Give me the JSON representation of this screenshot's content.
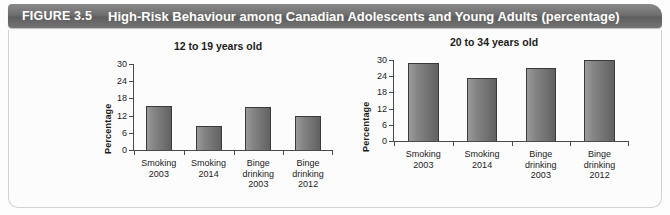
{
  "header": {
    "figure_number": "FIGURE 3.5",
    "title": "High-Risk Behaviour among Canadian Adolescents and Young Adults (percentage)",
    "banner_color": "#6f6f6f",
    "text_color": "#ffffff"
  },
  "chart_data": [
    {
      "type": "bar",
      "title": "12 to 19 years old",
      "xlabel": "",
      "ylabel": "Percentage",
      "ylim": [
        0,
        30
      ],
      "yticks": [
        0,
        6,
        12,
        18,
        24,
        30
      ],
      "grid": false,
      "legend": "none",
      "categories": [
        "Smoking\n2003",
        "Smoking\n2014",
        "Binge\ndrinking\n2003",
        "Binge\ndrinking\n2012"
      ],
      "category_lines": [
        [
          "Smoking",
          "2003"
        ],
        [
          "Smoking",
          "2014"
        ],
        [
          "Binge",
          "drinking",
          "2003"
        ],
        [
          "Binge",
          "drinking",
          "2012"
        ]
      ],
      "values": [
        15.5,
        8.5,
        15,
        12
      ],
      "bar_color": "#7b7b7b"
    },
    {
      "type": "bar",
      "title": "20 to 34 years old",
      "xlabel": "",
      "ylabel": "Percentage",
      "ylim": [
        0,
        30
      ],
      "yticks": [
        0,
        6,
        12,
        18,
        24,
        30
      ],
      "grid": false,
      "legend": "none",
      "categories": [
        "Smoking\n2003",
        "Smoking\n2014",
        "Binge\ndrinking\n2003",
        "Binge\ndrinking\n2012"
      ],
      "category_lines": [
        [
          "Smoking",
          "2003"
        ],
        [
          "Smoking",
          "2014"
        ],
        [
          "Binge",
          "drinking",
          "2003"
        ],
        [
          "Binge",
          "drinking",
          "2012"
        ]
      ],
      "values": [
        29,
        23.5,
        27,
        30
      ],
      "bar_color": "#7b7b7b"
    }
  ]
}
